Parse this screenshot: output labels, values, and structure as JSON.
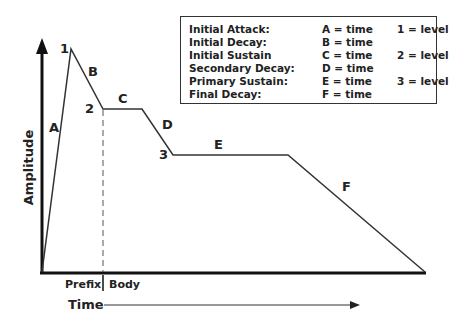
{
  "diagram": {
    "axes": {
      "y_label": "Amplitude",
      "x_label": "Time",
      "x_sections": [
        "Prefix",
        "Body"
      ]
    },
    "segment_labels": {
      "A": "A",
      "B": "B",
      "C": "C",
      "D": "D",
      "E": "E",
      "F": "F"
    },
    "point_labels": {
      "p1": "1",
      "p2": "2",
      "p3": "3"
    },
    "legend": {
      "rows": [
        {
          "name": "Initial Attack:",
          "time": "A = time",
          "level": "1 = level"
        },
        {
          "name": "Initial Decay:",
          "time": "B = time",
          "level": ""
        },
        {
          "name": "Initial Sustain",
          "time": "C = time",
          "level": "2 = level"
        },
        {
          "name": "Secondary Decay:",
          "time": "D = time",
          "level": ""
        },
        {
          "name": "Primary Sustain:",
          "time": "E = time",
          "level": "3 = level"
        },
        {
          "name": "Final Decay:",
          "time": "F = time",
          "level": ""
        }
      ]
    },
    "envelope_points": [
      [
        42,
        272
      ],
      [
        71,
        49
      ],
      [
        103,
        109
      ],
      [
        142,
        109
      ],
      [
        173,
        155
      ],
      [
        288,
        155
      ],
      [
        425,
        272
      ]
    ],
    "colors": {
      "line": "#333333",
      "axis": "#111111"
    }
  }
}
